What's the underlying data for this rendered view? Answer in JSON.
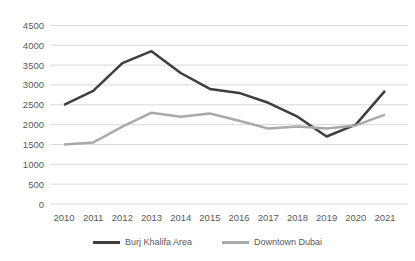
{
  "chart_data": {
    "type": "line",
    "x": [
      2010,
      2011,
      2012,
      2013,
      2014,
      2015,
      2016,
      2017,
      2018,
      2019,
      2020,
      2021
    ],
    "series": [
      {
        "name": "Burj Khalifa Area",
        "color": "#3e3e3e",
        "values": [
          2500,
          2850,
          3550,
          3850,
          3300,
          2900,
          2800,
          2550,
          2200,
          1700,
          2000,
          2850
        ]
      },
      {
        "name": "Downtown Dubai",
        "color": "#a9a9a9",
        "values": [
          1500,
          1550,
          1950,
          2300,
          2200,
          2280,
          2100,
          1900,
          1950,
          1900,
          1980,
          2250
        ]
      }
    ],
    "ylim": [
      0,
      4500
    ],
    "yticks": [
      0,
      500,
      1000,
      1500,
      2000,
      2500,
      3000,
      3500,
      4000,
      4500
    ],
    "grid": "horizontal",
    "legend_position": "bottom",
    "gridline_color": "#d9d9d9",
    "tick_label_color": "#595959"
  }
}
